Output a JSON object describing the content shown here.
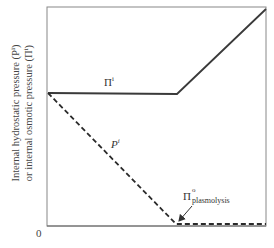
{
  "diagram": {
    "y_axis_label_line1": "Internal hydrostatic pressure (Pⁱ)",
    "y_axis_label_line2": "or internal osmotic pressure (Πⁱ)",
    "origin_label": "0",
    "curves": [
      {
        "name": "internal osmotic pressure",
        "label": "Π",
        "sup": "i",
        "style": "solid",
        "color": "#3a3a3a",
        "points": [
          [
            48,
            93
          ],
          [
            177,
            94
          ],
          [
            266,
            9
          ]
        ]
      },
      {
        "name": "internal hydrostatic pressure",
        "label": "P",
        "sup": "i",
        "style": "dashed",
        "color": "#2a2a2a",
        "points": [
          [
            48,
            93
          ],
          [
            176,
            224
          ],
          [
            266,
            224
          ]
        ]
      }
    ],
    "annotation": {
      "label": "Π",
      "sup": "o",
      "sub": "plasmolysis",
      "arrow_from": [
        192,
        207
      ],
      "arrow_to": [
        178,
        222
      ]
    },
    "frame": {
      "left": 47,
      "top": 7,
      "right": 266,
      "bottom": 226
    }
  }
}
